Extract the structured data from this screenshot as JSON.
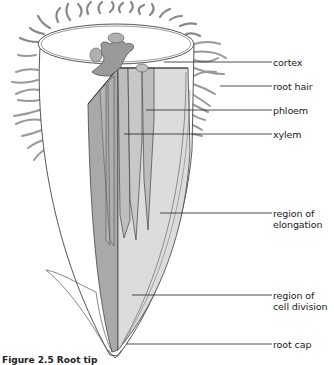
{
  "figure": {
    "caption": "Figure 2.5 Root tip"
  },
  "labels": [
    {
      "id": "cortex",
      "text": "cortex",
      "y": 38
    },
    {
      "id": "root-hair",
      "text": "root hair",
      "y": 63
    },
    {
      "id": "phloem",
      "text": "phloem",
      "y": 87
    },
    {
      "id": "xylem",
      "text": "xylem",
      "y": 111
    },
    {
      "id": "region-of-elongation",
      "text": "region of\nelongation",
      "y": 212
    },
    {
      "id": "region-of-cell-division",
      "text": "region of\ncell division",
      "y": 296
    },
    {
      "id": "root-cap",
      "text": "root cap",
      "y": 345
    }
  ],
  "colors": {
    "outline": "#444444",
    "dark_tissue": "#a9a9a9",
    "mid_tissue": "#bdbdbd",
    "light_tissue": "#dcdcdc",
    "stele_blob": "#9a9a9a",
    "background": "#ffffff"
  }
}
